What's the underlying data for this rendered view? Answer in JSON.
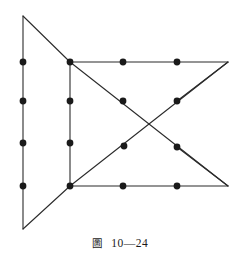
{
  "figure": {
    "caption_label": "圖",
    "caption_number": "10—24",
    "caption_full": "圖 10—24",
    "stroke_color": "#2b2b2b",
    "vertex_color": "#1a1a1a",
    "background_color": "#ffffff",
    "stroke_width": 1.1,
    "vertex_radius": 3.4
  },
  "chart_data": {
    "type": "diagram",
    "xlim": [
      0,
      240
    ],
    "ylim": [
      0,
      261
    ],
    "grid": false,
    "legend": null,
    "points": [
      {
        "name": "left-apex-top",
        "x": 23,
        "y": 16,
        "dot": false
      },
      {
        "name": "left-apex-bottom",
        "x": 23,
        "y": 229,
        "dot": false
      },
      {
        "name": "left-edge-p1",
        "x": 23,
        "y": 62,
        "dot": true
      },
      {
        "name": "left-edge-p2",
        "x": 23,
        "y": 101,
        "dot": true
      },
      {
        "name": "left-edge-p3",
        "x": 23,
        "y": 143,
        "dot": true
      },
      {
        "name": "left-edge-p4",
        "x": 23,
        "y": 186,
        "dot": true
      },
      {
        "name": "mid-top",
        "x": 70,
        "y": 62,
        "dot": true
      },
      {
        "name": "mid-p2",
        "x": 70,
        "y": 101,
        "dot": true
      },
      {
        "name": "mid-p3",
        "x": 70,
        "y": 143,
        "dot": true
      },
      {
        "name": "mid-bottom",
        "x": 70,
        "y": 186,
        "dot": true
      },
      {
        "name": "top-edge-p1",
        "x": 123,
        "y": 62,
        "dot": true
      },
      {
        "name": "top-edge-p2",
        "x": 177,
        "y": 62,
        "dot": true
      },
      {
        "name": "right-apex-top",
        "x": 228,
        "y": 62,
        "dot": false
      },
      {
        "name": "right-apex-bottom",
        "x": 228,
        "y": 186,
        "dot": false
      },
      {
        "name": "bottom-edge-p1",
        "x": 123,
        "y": 186,
        "dot": true
      },
      {
        "name": "bottom-edge-p2",
        "x": 177,
        "y": 186,
        "dot": true
      },
      {
        "name": "diag-a-p1",
        "x": 123,
        "y": 101,
        "dot": true
      },
      {
        "name": "diag-a-p2",
        "x": 177,
        "y": 147,
        "dot": true
      },
      {
        "name": "diag-b-p1",
        "x": 177,
        "y": 101,
        "dot": true
      },
      {
        "name": "diag-b-p2",
        "x": 124,
        "y": 146,
        "dot": true
      }
    ],
    "segments": [
      {
        "name": "left-vertical-edge",
        "x1": 23,
        "y1": 16,
        "x2": 23,
        "y2": 229
      },
      {
        "name": "left-triangle-upper-diagonal",
        "x1": 23,
        "y1": 16,
        "x2": 70,
        "y2": 62
      },
      {
        "name": "left-triangle-lower-diagonal",
        "x1": 23,
        "y1": 229,
        "x2": 70,
        "y2": 186
      },
      {
        "name": "middle-vertical-edge",
        "x1": 70,
        "y1": 62,
        "x2": 70,
        "y2": 186
      },
      {
        "name": "top-horizontal-edge",
        "x1": 70,
        "y1": 62,
        "x2": 228,
        "y2": 62
      },
      {
        "name": "bottom-horizontal-edge",
        "x1": 70,
        "y1": 186,
        "x2": 228,
        "y2": 186
      },
      {
        "name": "right-upper-diagonal",
        "x1": 228,
        "y1": 62,
        "x2": 177,
        "y2": 101
      },
      {
        "name": "right-lower-diagonal",
        "x1": 228,
        "y1": 186,
        "x2": 177,
        "y2": 147
      },
      {
        "name": "diagonal-top-left-to-bottom-right",
        "x1": 70,
        "y1": 62,
        "x2": 228,
        "y2": 186
      },
      {
        "name": "diagonal-bottom-left-to-top-right",
        "x1": 70,
        "y1": 186,
        "x2": 228,
        "y2": 62
      }
    ]
  }
}
